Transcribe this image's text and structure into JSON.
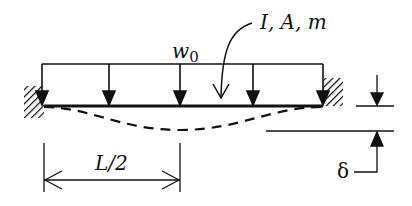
{
  "diagram": {
    "type": "fixed-fixed beam under uniform distributed load",
    "labels": {
      "load": "w",
      "load_sub": "0",
      "properties": "I, A, m",
      "half_span": "L/2",
      "deflection": "δ"
    },
    "load_arrows_count": 5,
    "supports": [
      "fixed-left",
      "fixed-right"
    ],
    "deflected_shape": "dashed",
    "colors": {
      "ink": "#111111",
      "background": "#ffffff"
    }
  }
}
